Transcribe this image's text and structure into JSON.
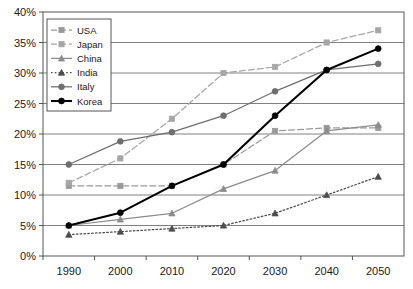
{
  "chart_data": {
    "type": "line",
    "title": "",
    "subtitle": "",
    "xlabel": "",
    "ylabel": "",
    "x": [
      1990,
      2000,
      2010,
      2020,
      2030,
      2040,
      2050
    ],
    "categories": [
      "1990",
      "2000",
      "2010",
      "2020",
      "2030",
      "2040",
      "2050"
    ],
    "xtick_labels": [
      "1990",
      "2000",
      "2010",
      "2020",
      "2030",
      "2040",
      "2050"
    ],
    "ytick_labels": [
      "0%",
      "5%",
      "10%",
      "15%",
      "20%",
      "25%",
      "30%",
      "35%",
      "40%"
    ],
    "ytick_values": [
      0,
      5,
      10,
      15,
      20,
      25,
      30,
      35,
      40
    ],
    "ylim": [
      0,
      40
    ],
    "xlim": [
      1985,
      2055
    ],
    "grid": true,
    "grid_axis": "y",
    "legend_position": "top-left",
    "value_suffix": "%",
    "series": [
      {
        "name": "USA",
        "values": [
          11.5,
          11.5,
          11.5,
          15.0,
          20.5,
          21.0,
          21.0
        ],
        "color": "#9a9a9a",
        "line_style": "dashed",
        "marker": "square"
      },
      {
        "name": "Japan",
        "values": [
          12.0,
          16.0,
          22.5,
          30.0,
          31.0,
          35.0,
          37.0
        ],
        "color": "#a6a6a6",
        "line_style": "dashed",
        "marker": "square"
      },
      {
        "name": "China",
        "values": [
          5.0,
          6.0,
          7.0,
          11.0,
          14.0,
          20.5,
          21.5
        ],
        "color": "#8c8c8c",
        "line_style": "solid",
        "marker": "triangle"
      },
      {
        "name": "India",
        "values": [
          3.5,
          4.0,
          4.5,
          5.0,
          7.0,
          10.0,
          13.0
        ],
        "color": "#4d4d4d",
        "line_style": "dotted",
        "marker": "triangle"
      },
      {
        "name": "Italy",
        "values": [
          15.0,
          18.8,
          20.3,
          23.0,
          27.0,
          30.5,
          31.5
        ],
        "color": "#6e6e6e",
        "line_style": "solid",
        "marker": "circle"
      },
      {
        "name": "Korea",
        "values": [
          5.0,
          7.1,
          11.5,
          15.0,
          23.0,
          30.5,
          34.0
        ],
        "color": "#000000",
        "line_style": "solid",
        "marker": "circle"
      }
    ]
  },
  "legend": {
    "items": [
      "USA",
      "Japan",
      "China",
      "India",
      "Italy",
      "Korea"
    ]
  },
  "colors": {
    "frame": "#555555",
    "grid": "#808080",
    "background": "#ffffff",
    "text": "#1a1a1a"
  }
}
